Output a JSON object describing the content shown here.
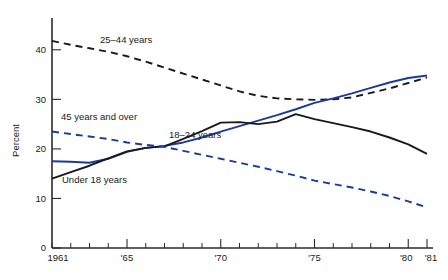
{
  "chart_data": {
    "type": "line",
    "title": "",
    "subtitle": "",
    "xlabel": "",
    "ylabel": "Percent",
    "xlim": [
      1961,
      1981
    ],
    "ylim": [
      0,
      45
    ],
    "grid": false,
    "legend_position": "inline-annotations",
    "y_ticks": [
      "0",
      "10",
      "20",
      "30",
      "40"
    ],
    "y_tick_values": [
      0,
      10,
      20,
      30,
      40
    ],
    "x_ticks": [
      "1961",
      "'65",
      "'70",
      "'75",
      "'80",
      "'81"
    ],
    "x_tick_values": [
      1961,
      1965,
      1970,
      1975,
      1980,
      1981
    ],
    "x": [
      1961,
      1962,
      1963,
      1964,
      1965,
      1966,
      1967,
      1968,
      1969,
      1970,
      1971,
      1972,
      1973,
      1974,
      1975,
      1976,
      1977,
      1978,
      1979,
      1980,
      1981
    ],
    "series": [
      {
        "name": "25–44 years",
        "color": "#1a1a1a",
        "style": "dashed",
        "label": "25–44 years",
        "values": [
          41.8,
          41.0,
          40.3,
          39.6,
          38.7,
          37.6,
          36.4,
          35.2,
          34.0,
          32.8,
          31.6,
          30.7,
          30.2,
          30.0,
          29.9,
          30.0,
          30.4,
          31.3,
          32.2,
          33.3,
          34.4
        ]
      },
      {
        "name": "18–24 years",
        "color": "#1a3a9c",
        "style": "solid",
        "label": "18–24 years",
        "values": [
          17.5,
          17.4,
          17.2,
          18.0,
          19.4,
          20.2,
          20.6,
          21.3,
          22.3,
          23.5,
          24.6,
          25.7,
          26.8,
          28.0,
          29.3,
          30.2,
          31.2,
          32.3,
          33.4,
          34.3,
          34.8
        ]
      },
      {
        "name": "Under 18 years",
        "color": "#1a1a1a",
        "style": "solid",
        "label": "Under 18 years",
        "values": [
          14.0,
          15.3,
          16.6,
          18.1,
          19.5,
          20.2,
          20.5,
          22.0,
          23.6,
          25.3,
          25.4,
          25.0,
          25.5,
          27.0,
          26.0,
          25.2,
          24.4,
          23.5,
          22.3,
          20.9,
          19.0
        ]
      },
      {
        "name": "45 years and over",
        "color": "#1a3a9c",
        "style": "dashed",
        "label": "45 years and over",
        "values": [
          23.5,
          23.0,
          22.5,
          22.0,
          21.3,
          20.8,
          20.4,
          19.6,
          18.8,
          18.0,
          17.2,
          16.4,
          15.5,
          14.6,
          13.6,
          12.9,
          12.2,
          11.4,
          10.5,
          9.4,
          8.2
        ]
      }
    ],
    "annotations": [
      {
        "text": "25–44 years",
        "x": 100,
        "y": 43
      },
      {
        "text": "45 years and over",
        "x": 61,
        "y": 120
      },
      {
        "text": "18–24 years",
        "x": 169,
        "y": 138
      },
      {
        "text": "Under 18 years",
        "x": 62,
        "y": 183
      }
    ]
  }
}
